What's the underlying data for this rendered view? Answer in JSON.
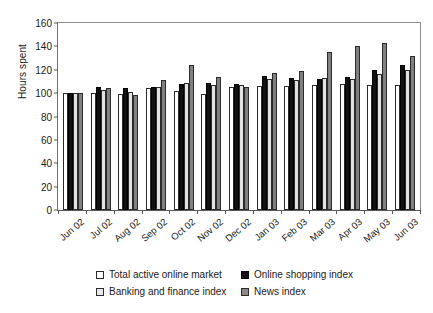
{
  "chart_data": {
    "type": "bar",
    "title": "",
    "xlabel": "",
    "ylabel": "Hours spent",
    "ylim": [
      0,
      160
    ],
    "ytick_step": 20,
    "yticks": [
      0,
      20,
      40,
      60,
      80,
      100,
      120,
      140,
      160
    ],
    "grid": false,
    "legend_position": "bottom",
    "categories": [
      "Jun 02",
      "Jul 02",
      "Aug 02",
      "Sep 02",
      "Oct 02",
      "Nov 02",
      "Dec 02",
      "Jan 03",
      "Feb 03",
      "Mar 03",
      "Apr 03",
      "May 03",
      "Jun 03"
    ],
    "series": [
      {
        "name": "Total active online market",
        "color": "#ffffff",
        "values": [
          100,
          100,
          99,
          104,
          102,
          99,
          105,
          106,
          106,
          107,
          108,
          107,
          107
        ]
      },
      {
        "name": "Online shopping index",
        "color": "#111111",
        "values": [
          100,
          105,
          104,
          105,
          108,
          109,
          108,
          115,
          113,
          112,
          114,
          120,
          124
        ]
      },
      {
        "name": "Banking and finance index",
        "color": "#e2e2e2",
        "values": [
          100,
          103,
          101,
          105,
          109,
          107,
          107,
          112,
          111,
          113,
          112,
          116,
          120
        ]
      },
      {
        "name": "News index",
        "color": "#808080",
        "values": [
          100,
          104,
          98,
          111,
          124,
          114,
          105,
          117,
          119,
          135,
          140,
          143,
          132
        ]
      }
    ]
  },
  "axis": {
    "ylabel": "Hours spent"
  },
  "legend": {
    "items": [
      {
        "label": "Total active online market",
        "swatch": "white-square-icon"
      },
      {
        "label": "Online shopping index",
        "swatch": "black-square-icon"
      },
      {
        "label": "Banking and finance index",
        "swatch": "light-gray-square-icon"
      },
      {
        "label": "News index",
        "swatch": "dark-gray-square-icon"
      }
    ]
  }
}
